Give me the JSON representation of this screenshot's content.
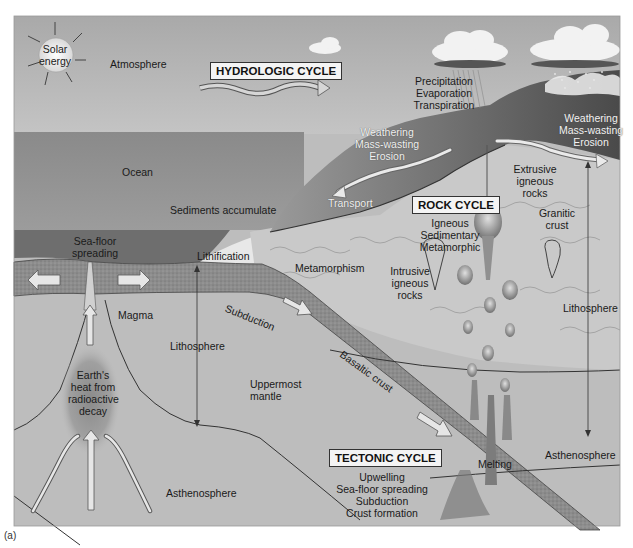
{
  "figure": {
    "caption": "(a)",
    "colors": {
      "sky": "#b9b9b9",
      "ocean": "#8e8e8e",
      "ocean_deep": "#6f6f6f",
      "land": "#7a7a7a",
      "continental_crust": "#c7c7c7",
      "oceanic_crust": "#9a9a9a",
      "mantle": "#bdbdbd",
      "asthenosphere": "#b5b5b5",
      "label_box": "#f4f4f4"
    }
  },
  "atmosphere": {
    "sun_label_1": "Solar",
    "sun_label_2": "energy",
    "atmosphere_label": "Atmosphere"
  },
  "hydrologic": {
    "title": "HYDROLOGIC CYCLE",
    "processes": [
      "Precipitation",
      "Evaporation",
      "Transpiration"
    ]
  },
  "surface": {
    "weathering_left": [
      "Weathering",
      "Mass-wasting",
      "Erosion"
    ],
    "weathering_right": [
      "Weathering",
      "Mass-wasting",
      "Erosion"
    ],
    "transport": "Transport",
    "ocean": "Ocean",
    "sediments": "Sediments accumulate",
    "lithification": "Lithification",
    "sea_floor_spreading": [
      "Sea-floor",
      "spreading"
    ]
  },
  "rock": {
    "title": "ROCK CYCLE",
    "types": [
      "Igneous",
      "Sedimentary",
      "Metamorphic"
    ],
    "extrusive": [
      "Extrusive",
      "igneous",
      "rocks"
    ],
    "intrusive": [
      "Intrusive",
      "igneous",
      "rocks"
    ],
    "granitic": [
      "Granitic",
      "crust"
    ],
    "metamorphism": "Metamorphism"
  },
  "interior": {
    "magma": "Magma",
    "heat": [
      "Earth's",
      "heat from",
      "radioactive",
      "decay"
    ],
    "lithosphere_left": "Lithosphere",
    "lithosphere_right": "Lithosphere",
    "uppermost_mantle": [
      "Uppermost",
      "mantle"
    ],
    "asthenosphere_left": "Asthenosphere",
    "asthenosphere_right": "Asthenosphere",
    "subduction": "Subduction",
    "basaltic_crust": "Basaltic crust",
    "melting": "Melting"
  },
  "tectonic": {
    "title": "TECTONIC CYCLE",
    "processes": [
      "Upwelling",
      "Sea-floor spreading",
      "Subduction",
      "Crust formation"
    ]
  }
}
